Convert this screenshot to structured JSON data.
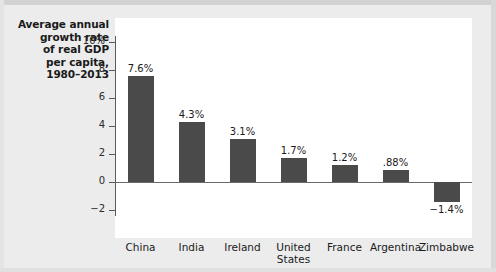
{
  "chart_data": {
    "type": "bar",
    "title": "Average annual growth rate of real GDP per capita, 1980–2013",
    "title_lines": [
      "Average annual",
      "growth rate",
      "of real GDP",
      "per capita,",
      "1980–2013"
    ],
    "xlabel": "",
    "ylabel": "",
    "ylim": [
      -2,
      11
    ],
    "grid": false,
    "legend": null,
    "bar_color": "#4a4a4a",
    "plot_background": "#ffffff",
    "page_background": "#ececec",
    "ytick_labels": [
      "10%",
      "8",
      "6",
      "4",
      "2",
      "0",
      "−2"
    ],
    "ytick_values": [
      10,
      8,
      6,
      4,
      2,
      0,
      -2
    ],
    "categories": [
      "China",
      "India",
      "Ireland",
      "United States",
      "France",
      "Argentina",
      "Zimbabwe"
    ],
    "category_lines": [
      [
        "China"
      ],
      [
        "India"
      ],
      [
        "Ireland"
      ],
      [
        "United",
        "States"
      ],
      [
        "France"
      ],
      [
        "Argentina"
      ],
      [
        "Zimbabwe"
      ]
    ],
    "values": [
      7.6,
      4.3,
      3.1,
      1.7,
      1.2,
      0.88,
      -1.4
    ],
    "value_labels": [
      "7.6%",
      "4.3%",
      "3.1%",
      "1.7%",
      "1.2%",
      ".88%",
      "−1.4%"
    ]
  }
}
